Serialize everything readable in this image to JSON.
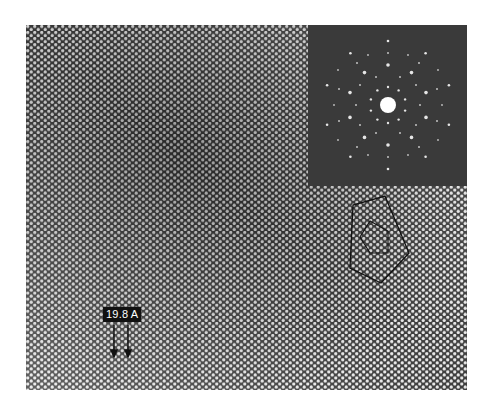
{
  "figure": {
    "scale_label": "19.8 A",
    "colors": {
      "background": "#ffffff",
      "micrograph_mid": "#5a5a5a",
      "inset_background": "#3a3a3a",
      "spots": "#f2f2f2",
      "label_background": "#111111",
      "label_text": "#ffffff"
    },
    "annotations": {
      "pentagons": "two nested pentagons outlining a decagonal cluster",
      "arrows": "two downward arrows marking a 19.8 A spacing"
    },
    "inset": {
      "type": "electron-diffraction-pattern",
      "symmetry": "tenfold"
    }
  }
}
